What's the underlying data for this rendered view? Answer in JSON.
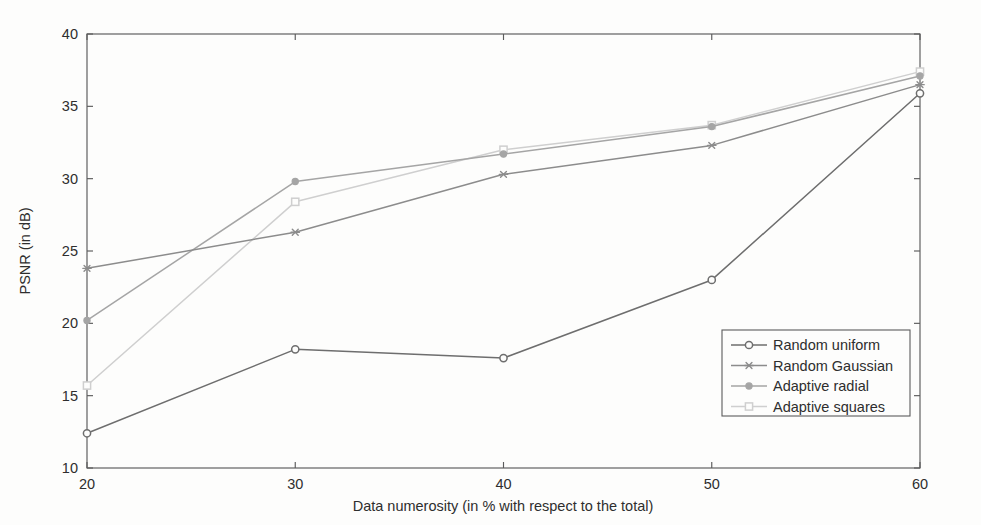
{
  "chart_data": {
    "type": "line",
    "title": "",
    "xlabel": "Data numerosity (in % with respect to the total)",
    "ylabel": "PSNR (in dB)",
    "x": [
      20,
      30,
      40,
      50,
      60
    ],
    "xlim": [
      20,
      60
    ],
    "ylim": [
      10,
      40
    ],
    "xticks": [
      20,
      30,
      40,
      50,
      60
    ],
    "yticks": [
      10,
      15,
      20,
      25,
      30,
      35,
      40
    ],
    "xtick_labels": [
      "20",
      "30",
      "40",
      "50",
      "60"
    ],
    "ytick_labels": [
      "10",
      "15",
      "20",
      "25",
      "30",
      "35",
      "40"
    ],
    "grid": false,
    "legend_position": "lower right",
    "series": [
      {
        "name": "Random uniform",
        "marker": "circle-open",
        "color": "#6e6e6e",
        "values": [
          12.4,
          18.2,
          17.6,
          23.0,
          35.9
        ]
      },
      {
        "name": "Random Gaussian",
        "marker": "asterisk",
        "color": "#8c8c8c",
        "values": [
          23.8,
          26.3,
          30.3,
          32.3,
          36.5
        ]
      },
      {
        "name": "Adaptive radial",
        "marker": "circle-filled",
        "color": "#a5a5a5",
        "values": [
          20.2,
          29.8,
          31.7,
          33.6,
          37.1
        ]
      },
      {
        "name": "Adaptive squares",
        "marker": "square-open",
        "color": "#cfcfcf",
        "values": [
          15.7,
          28.4,
          32.0,
          33.7,
          37.4
        ]
      }
    ]
  },
  "axes": {
    "frame_color": "#5b5b5b",
    "background": "#fdfdfc"
  },
  "legend": {
    "border_color": "#5b5b5b",
    "entries": [
      {
        "label": "Random uniform"
      },
      {
        "label": "Random Gaussian"
      },
      {
        "label": "Adaptive radial"
      },
      {
        "label": "Adaptive squares"
      }
    ]
  }
}
